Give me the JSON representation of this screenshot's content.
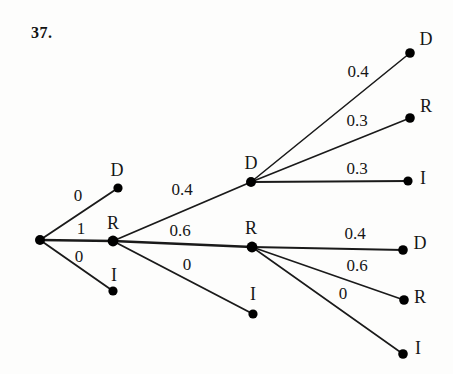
{
  "problem": {
    "number": "37."
  },
  "diagram": {
    "type": "probability-tree",
    "stroke_color": "#1a1a1a",
    "node_color": "#000000",
    "background": "#fdfdfc",
    "nodes": [
      {
        "id": "root",
        "label": "",
        "x": 40,
        "y": 240,
        "r": 5.0
      },
      {
        "id": "n1-D",
        "label": "D",
        "x": 118,
        "y": 188,
        "r": 4.6,
        "label_x": 117,
        "label_y": 170
      },
      {
        "id": "n1-R",
        "label": "R",
        "x": 113,
        "y": 241,
        "r": 5.4,
        "label_x": 113,
        "label_y": 223
      },
      {
        "id": "n1-I",
        "label": "I",
        "x": 113,
        "y": 291,
        "r": 4.6,
        "label_x": 114,
        "label_y": 275
      },
      {
        "id": "n2-D",
        "label": "D",
        "x": 251,
        "y": 182,
        "r": 5.0,
        "label_x": 251,
        "label_y": 163
      },
      {
        "id": "n2-R",
        "label": "R",
        "x": 252,
        "y": 247,
        "r": 5.4,
        "label_x": 251,
        "label_y": 228
      },
      {
        "id": "n2-I",
        "label": "I",
        "x": 253,
        "y": 314,
        "r": 4.6,
        "label_x": 253,
        "label_y": 294
      },
      {
        "id": "n3-D-D",
        "label": "D",
        "x": 410,
        "y": 53,
        "r": 4.8,
        "label_x": 426,
        "label_y": 39
      },
      {
        "id": "n3-D-R",
        "label": "R",
        "x": 410,
        "y": 118,
        "r": 4.8,
        "label_x": 426,
        "label_y": 106
      },
      {
        "id": "n3-D-I",
        "label": "I",
        "x": 408,
        "y": 181,
        "r": 4.6,
        "label_x": 423,
        "label_y": 178
      },
      {
        "id": "n3-R-D",
        "label": "D",
        "x": 403,
        "y": 250,
        "r": 4.8,
        "label_x": 420,
        "label_y": 243
      },
      {
        "id": "n3-R-R",
        "label": "R",
        "x": 404,
        "y": 300,
        "r": 4.8,
        "label_x": 420,
        "label_y": 297
      },
      {
        "id": "n3-R-I",
        "label": "I",
        "x": 403,
        "y": 354,
        "r": 4.8,
        "label_x": 418,
        "label_y": 348
      }
    ],
    "edges": [
      {
        "id": "e-root-D",
        "from": "root",
        "to": "n1-D",
        "x1": 40,
        "y1": 240,
        "x2": 118,
        "y2": 188,
        "weight": "0",
        "label_x": 78,
        "label_y": 195,
        "width": 1.9
      },
      {
        "id": "e-root-R",
        "from": "root",
        "to": "n1-R",
        "x1": 40,
        "y1": 240,
        "x2": 113,
        "y2": 241,
        "weight": "1",
        "label_x": 81,
        "label_y": 228,
        "width": 2.4
      },
      {
        "id": "e-root-I",
        "from": "root",
        "to": "n1-I",
        "x1": 40,
        "y1": 240,
        "x2": 113,
        "y2": 291,
        "weight": "0",
        "label_x": 79,
        "label_y": 256,
        "width": 1.9
      },
      {
        "id": "e-R-D",
        "from": "n1-R",
        "to": "n2-D",
        "x1": 113,
        "y1": 241,
        "x2": 251,
        "y2": 182,
        "weight": "0.4",
        "label_x": 182,
        "label_y": 189,
        "width": 1.9
      },
      {
        "id": "e-R-R",
        "from": "n1-R",
        "to": "n2-R",
        "x1": 113,
        "y1": 241,
        "x2": 252,
        "y2": 247,
        "weight": "0.6",
        "label_x": 180,
        "label_y": 230,
        "width": 2.4
      },
      {
        "id": "e-R-I",
        "from": "n1-R",
        "to": "n2-I",
        "x1": 113,
        "y1": 241,
        "x2": 253,
        "y2": 314,
        "weight": "0",
        "label_x": 187,
        "label_y": 264,
        "width": 1.9
      },
      {
        "id": "e-D2-D",
        "from": "n2-D",
        "to": "n3-D-D",
        "x1": 251,
        "y1": 182,
        "x2": 410,
        "y2": 53,
        "weight": "0.4",
        "label_x": 358,
        "label_y": 71,
        "width": 1.6
      },
      {
        "id": "e-D2-R",
        "from": "n2-D",
        "to": "n3-D-R",
        "x1": 251,
        "y1": 182,
        "x2": 410,
        "y2": 118,
        "weight": "0.3",
        "label_x": 357,
        "label_y": 120,
        "width": 1.6
      },
      {
        "id": "e-D2-I",
        "from": "n2-D",
        "to": "n3-D-I",
        "x1": 251,
        "y1": 182,
        "x2": 408,
        "y2": 181,
        "weight": "0.3",
        "label_x": 357,
        "label_y": 168,
        "width": 1.9
      },
      {
        "id": "e-R2-D",
        "from": "n2-R",
        "to": "n3-R-D",
        "x1": 252,
        "y1": 247,
        "x2": 403,
        "y2": 250,
        "weight": "0.4",
        "label_x": 355,
        "label_y": 233,
        "width": 2.2
      },
      {
        "id": "e-R2-R",
        "from": "n2-R",
        "to": "n3-R-R",
        "x1": 252,
        "y1": 247,
        "x2": 404,
        "y2": 300,
        "weight": "0.6",
        "label_x": 357,
        "label_y": 265,
        "width": 1.6
      },
      {
        "id": "e-R2-I",
        "from": "n2-R",
        "to": "n3-R-I",
        "x1": 252,
        "y1": 247,
        "x2": 403,
        "y2": 354,
        "weight": "0",
        "label_x": 343,
        "label_y": 293,
        "width": 1.6
      }
    ]
  }
}
